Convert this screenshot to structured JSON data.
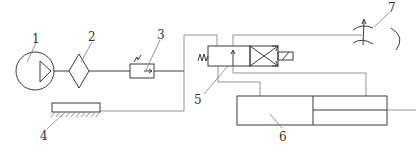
{
  "diagram": {
    "type": "hydraulic-schematic",
    "labels": {
      "pump": "1",
      "filter": "2",
      "valve": "3",
      "tank": "4",
      "directional_valve": "5",
      "cylinder": "6",
      "throttle": "7"
    },
    "components": [
      {
        "id": "1",
        "name": "pump"
      },
      {
        "id": "2",
        "name": "filter"
      },
      {
        "id": "3",
        "name": "pressure-valve"
      },
      {
        "id": "4",
        "name": "tank"
      },
      {
        "id": "5",
        "name": "directional-control-valve"
      },
      {
        "id": "6",
        "name": "hydraulic-cylinder"
      },
      {
        "id": "7",
        "name": "throttle-valve"
      }
    ],
    "line_color": "#3a3a3a",
    "background": "#ffffff"
  }
}
